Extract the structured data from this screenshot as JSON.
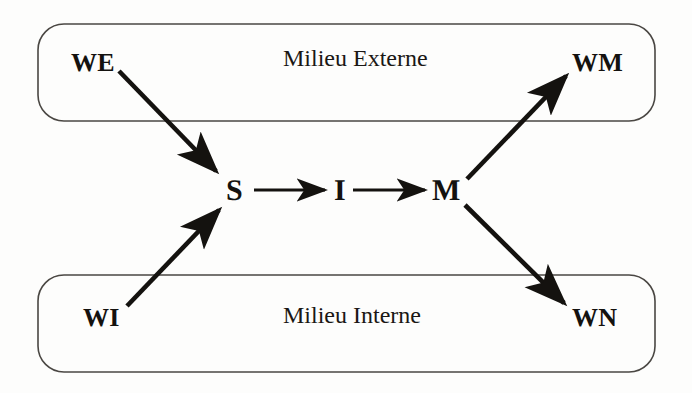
{
  "figure": {
    "background_color": "#fdfdfc",
    "ink_color": "#14120f"
  },
  "regions": [
    {
      "id": "milieu-externe",
      "label": "Milieu Externe",
      "position": "top"
    },
    {
      "id": "milieu-interne",
      "label": "Milieu Interne",
      "position": "bottom"
    }
  ],
  "nodes": {
    "we": "WE",
    "wm": "WM",
    "wi": "WI",
    "wn": "WN",
    "s": "S",
    "i": "I",
    "m": "M"
  },
  "edges": [
    {
      "id": "we-to-s",
      "from": "WE",
      "to": "S",
      "direction": "down-right"
    },
    {
      "id": "wi-to-s",
      "from": "WI",
      "to": "S",
      "direction": "up-right"
    },
    {
      "id": "s-to-i",
      "from": "S",
      "to": "I",
      "direction": "right"
    },
    {
      "id": "i-to-m",
      "from": "I",
      "to": "M",
      "direction": "right"
    },
    {
      "id": "m-to-wm",
      "from": "M",
      "to": "WM",
      "direction": "up-right"
    },
    {
      "id": "m-to-wn",
      "from": "M",
      "to": "WN",
      "direction": "down-right"
    }
  ]
}
